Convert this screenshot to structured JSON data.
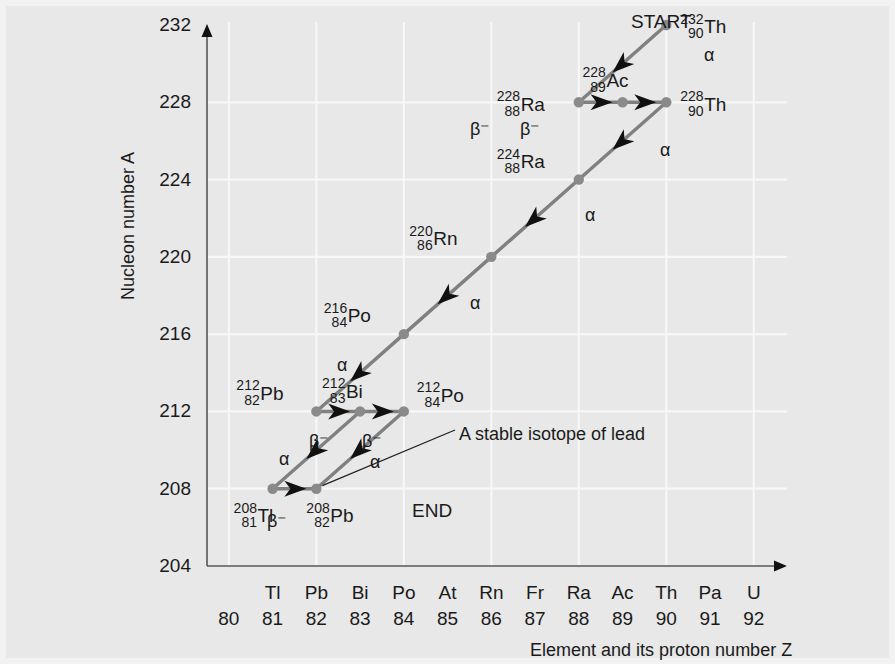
{
  "figure": {
    "background_color": "#e8e8e8",
    "grid_color": "#f7f7f7",
    "axis_color": "#555555",
    "path_color": "#808080",
    "arrow_color": "#111111",
    "node_color": "#8a8a8a"
  },
  "axes": {
    "y_title": "Nucleon number A",
    "x_title": "Element and its proton number Z",
    "y_ticks": [
      232,
      228,
      224,
      220,
      216,
      212,
      208,
      204
    ],
    "y_range": [
      204,
      232
    ],
    "x_range": [
      79.5,
      92.6
    ],
    "x_numbers": [
      80,
      81,
      82,
      83,
      84,
      85,
      86,
      87,
      88,
      89,
      90,
      91,
      92
    ],
    "x_symbols": [
      "",
      "Tl",
      "Pb",
      "Bi",
      "Po",
      "At",
      "Rn",
      "Fr",
      "Ra",
      "Ac",
      "Th",
      "Pa",
      "U"
    ],
    "gridlines_x": [
      80,
      82,
      84,
      86,
      88,
      90,
      92
    ],
    "gridlines_y": [
      228,
      224,
      220,
      216,
      212,
      208,
      204
    ]
  },
  "annotations": {
    "start": "START",
    "end": "END",
    "callout": "A stable isotope of lead"
  },
  "chart_data": {
    "type": "scatter",
    "title": "",
    "xlabel": "Element and its proton number Z",
    "ylabel": "Nucleon number A",
    "xlim": [
      79.5,
      92.6
    ],
    "ylim": [
      204,
      232
    ],
    "grid": true,
    "nuclides": [
      {
        "id": "Th232",
        "symbol": "Th",
        "A": 232,
        "Z": 90,
        "label_side": "right"
      },
      {
        "id": "Ra228",
        "symbol": "Ra",
        "A": 228,
        "Z": 88,
        "label_side": "left"
      },
      {
        "id": "Ac228",
        "symbol": "Ac",
        "A": 228,
        "Z": 89,
        "label_side": "above"
      },
      {
        "id": "Th228",
        "symbol": "Th",
        "A": 228,
        "Z": 90,
        "label_side": "right"
      },
      {
        "id": "Ra224",
        "symbol": "Ra",
        "A": 224,
        "Z": 88,
        "label_side": "upleft"
      },
      {
        "id": "Rn220",
        "symbol": "Rn",
        "A": 220,
        "Z": 86,
        "label_side": "upleft"
      },
      {
        "id": "Po216",
        "symbol": "Po",
        "A": 216,
        "Z": 84,
        "label_side": "upleft"
      },
      {
        "id": "Pb212",
        "symbol": "Pb",
        "A": 212,
        "Z": 82,
        "label_side": "upleft"
      },
      {
        "id": "Bi212",
        "symbol": "Bi",
        "A": 212,
        "Z": 83,
        "label_side": "above"
      },
      {
        "id": "Po212",
        "symbol": "Po",
        "A": 212,
        "Z": 84,
        "label_side": "right"
      },
      {
        "id": "Tl208",
        "symbol": "Tl",
        "A": 208,
        "Z": 81,
        "label_side": "below"
      },
      {
        "id": "Pb208",
        "symbol": "Pb",
        "A": 208,
        "Z": 82,
        "label_side": "below"
      }
    ],
    "decays": [
      {
        "from": "Th232",
        "to": "Ra228",
        "mode": "alpha",
        "mode_label": "α"
      },
      {
        "from": "Ra228",
        "to": "Ac228",
        "mode": "beta-",
        "mode_label": "β⁻"
      },
      {
        "from": "Ac228",
        "to": "Th228",
        "mode": "beta-",
        "mode_label": "β⁻"
      },
      {
        "from": "Th228",
        "to": "Ra224",
        "mode": "alpha",
        "mode_label": "α"
      },
      {
        "from": "Ra224",
        "to": "Rn220",
        "mode": "alpha",
        "mode_label": "α"
      },
      {
        "from": "Rn220",
        "to": "Po216",
        "mode": "alpha",
        "mode_label": "α"
      },
      {
        "from": "Po216",
        "to": "Pb212",
        "mode": "alpha",
        "mode_label": "α"
      },
      {
        "from": "Pb212",
        "to": "Bi212",
        "mode": "beta-",
        "mode_label": "β⁻"
      },
      {
        "from": "Bi212",
        "to": "Tl208",
        "mode": "alpha",
        "mode_label": "α"
      },
      {
        "from": "Bi212",
        "to": "Po212",
        "mode": "beta-",
        "mode_label": "β⁻"
      },
      {
        "from": "Tl208",
        "to": "Pb208",
        "mode": "beta-",
        "mode_label": "β⁻"
      },
      {
        "from": "Po212",
        "to": "Pb208",
        "mode": "alpha",
        "mode_label": "α"
      }
    ],
    "decay_label_positions": [
      {
        "index": 0,
        "x": 704,
        "y": 45,
        "text_x": 648,
        "text_y": 22,
        "start_text": true
      },
      {
        "index": 1,
        "x": 470,
        "y": 118
      },
      {
        "index": 2,
        "x": 520,
        "y": 118
      },
      {
        "index": 3,
        "x": 660,
        "y": 140
      },
      {
        "index": 4,
        "x": 585,
        "y": 205
      },
      {
        "index": 5,
        "x": 470,
        "y": 293
      },
      {
        "index": 6,
        "x": 337,
        "y": 355
      },
      {
        "index": 7,
        "x": 309,
        "y": 430
      },
      {
        "index": 8,
        "x": 279,
        "y": 449
      },
      {
        "index": 9,
        "x": 362,
        "y": 430
      },
      {
        "index": 10,
        "x": 267,
        "y": 510
      },
      {
        "index": 11,
        "x": 370,
        "y": 452
      }
    ]
  }
}
